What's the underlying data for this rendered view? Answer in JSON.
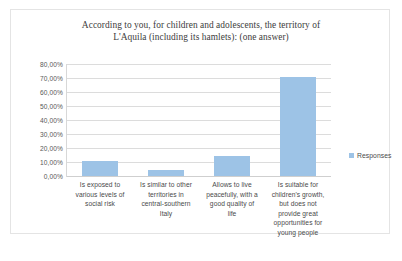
{
  "chart_data": {
    "type": "bar",
    "title": "According to you, for children and adolescents, the territory of L'Aquila (including its hamlets): (one answer)",
    "title_lines": [
      "According to you, for children and adolescents, the territory of",
      "L'Aquila (including its hamlets): (one answer)"
    ],
    "categories": [
      "Is exposed to various levels of social risk",
      "Is similar to other territories in central-southern Italy",
      "Allows to live peacefully, with a good quality of life",
      "Is suitable for children's growth, but does not provide great opportunities for young people"
    ],
    "category_lines": [
      [
        "Is exposed to",
        "various levels of",
        "social risk"
      ],
      [
        "Is similar to other",
        "territories in",
        "central-southern",
        "Italy"
      ],
      [
        "Allows to live",
        "peacefully, with a",
        "good quality of",
        "life"
      ],
      [
        "Is suitable for",
        "children's growth,",
        "but does not",
        "provide great",
        "opportunities for",
        "young people"
      ]
    ],
    "values": [
      11,
      4,
      14,
      71
    ],
    "series": [
      {
        "name": "Responses",
        "values": [
          11,
          4,
          14,
          71
        ]
      }
    ],
    "xlabel": "",
    "ylabel": "",
    "ylim": [
      0,
      80
    ],
    "ytick_values": [
      80,
      70,
      60,
      50,
      40,
      30,
      20,
      10,
      0
    ],
    "ytick_labels": [
      "80,00%",
      "70,00%",
      "60,00%",
      "50,00%",
      "40,00%",
      "30,00%",
      "20,00%",
      "10,00%",
      "0,00%"
    ],
    "grid": true,
    "legend_position": "right",
    "bar_color": "#9dc3e6",
    "gridline_color": "#dcdcdc",
    "text_color": "#4a4a4a"
  },
  "legend": {
    "entries": [
      {
        "label": "Responses",
        "color": "#9dc3e6"
      }
    ]
  }
}
